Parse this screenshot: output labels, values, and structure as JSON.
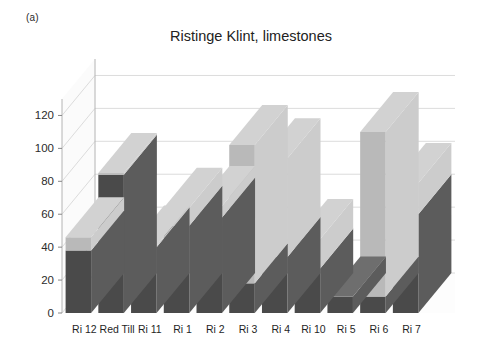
{
  "figure": {
    "panel_label": "(a)",
    "title": "Ristinge Klint, limestones"
  },
  "chart_data": {
    "type": "bar",
    "subtype": "stacked-3d-column",
    "title": "Ristinge Klint, limestones",
    "xlabel": "",
    "ylabel": "",
    "ylim": [
      0,
      130
    ],
    "yticks": [
      0,
      20,
      40,
      60,
      80,
      100,
      120
    ],
    "ytick_labels": [
      "0",
      "20",
      "40",
      "60",
      "80",
      "100",
      "120"
    ],
    "grid": true,
    "legend": "none",
    "categories": [
      "Ri 12",
      "Red Till",
      "Ri 11",
      "Ri 1",
      "Ri 2",
      "Ri 3",
      "Ri 4",
      "Ri 10",
      "Ri 5",
      "Ri 6",
      "Ri 7"
    ],
    "series": [
      {
        "name": "lower (dark)",
        "color": "#4a4a4a",
        "values": [
          38,
          84,
          40,
          53,
          58,
          18,
          34,
          27,
          10,
          10,
          60
        ]
      },
      {
        "name": "upper (light)",
        "color": "#b9b9b9",
        "values": [
          8,
          1,
          1,
          11,
          7,
          84,
          60,
          18,
          0,
          100,
          19
        ]
      }
    ],
    "totals": [
      46,
      85,
      41,
      64,
      65,
      102,
      94,
      45,
      10,
      110,
      79
    ],
    "colors": {
      "bar_front_dark": "#4a4a4a",
      "bar_front_light": "#b9b9b9",
      "bar_top_dark": "#6e6e6e",
      "bar_top_light": "#d2d2d2",
      "bar_side_dark": "#5c5c5c",
      "bar_side_light": "#cccccc",
      "floor": "#f4f4f4",
      "gridline": "#dcdcdc",
      "axis": "#b4b4b4",
      "text": "#222222"
    }
  }
}
